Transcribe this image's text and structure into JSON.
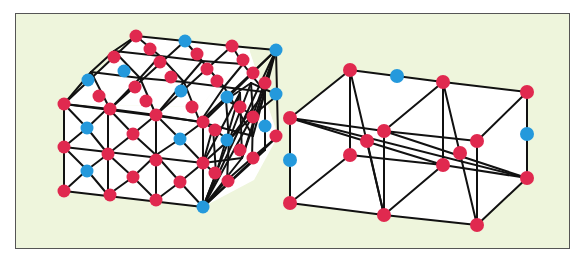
{
  "colors": {
    "background": "#eef5dc",
    "face": "#ffffff",
    "edge": "#111111",
    "red_node": "#e0294f",
    "blue_node": "#2499dc",
    "frame_border": "#555555"
  },
  "left_structure": {
    "name": "dense-triangulated-mesh-box",
    "faces": [
      {
        "name": "top",
        "points": "136,36 249,49 249,49 250,50 200,107 64,104"
      },
      {
        "name": "front",
        "points": "64,104 200,107 203,207 64,191"
      },
      {
        "name": "side",
        "points": "200,107 249,49 278,136 254,180 203,207"
      }
    ],
    "edges": [
      [
        136,
        36,
        185,
        41
      ],
      [
        185,
        41,
        232,
        46
      ],
      [
        232,
        46,
        276,
        50
      ],
      [
        114,
        51,
        160,
        56
      ],
      [
        160,
        56,
        202,
        61
      ],
      [
        202,
        61,
        243,
        64
      ],
      [
        91,
        72,
        140,
        78
      ],
      [
        140,
        78,
        184,
        82
      ],
      [
        184,
        82,
        224,
        87
      ],
      [
        224,
        87,
        265,
        92
      ],
      [
        64,
        104,
        110,
        109
      ],
      [
        110,
        109,
        156,
        115
      ],
      [
        156,
        115,
        200,
        122
      ],
      [
        200,
        122,
        253,
        136
      ],
      [
        136,
        36,
        64,
        104
      ],
      [
        185,
        41,
        110,
        109
      ],
      [
        232,
        46,
        156,
        115
      ],
      [
        276,
        50,
        200,
        122
      ],
      [
        136,
        36,
        160,
        56
      ],
      [
        160,
        56,
        184,
        82
      ],
      [
        184,
        82,
        200,
        122
      ],
      [
        185,
        41,
        202,
        61
      ],
      [
        202,
        61,
        224,
        87
      ],
      [
        224,
        87,
        253,
        136
      ],
      [
        232,
        46,
        243,
        64
      ],
      [
        243,
        64,
        265,
        92
      ],
      [
        114,
        51,
        140,
        78
      ],
      [
        140,
        78,
        156,
        115
      ],
      [
        91,
        72,
        110,
        109
      ],
      [
        136,
        36,
        114,
        51
      ],
      [
        114,
        51,
        91,
        72
      ],
      [
        91,
        72,
        64,
        104
      ],
      [
        160,
        56,
        140,
        78
      ],
      [
        140,
        78,
        110,
        109
      ],
      [
        202,
        61,
        184,
        82
      ],
      [
        184,
        82,
        156,
        115
      ],
      [
        243,
        64,
        224,
        87
      ],
      [
        224,
        87,
        200,
        122
      ],
      [
        276,
        50,
        265,
        92
      ],
      [
        265,
        92,
        253,
        136
      ],
      [
        64,
        104,
        64,
        191
      ],
      [
        108,
        108,
        108,
        195
      ],
      [
        156,
        115,
        156,
        200
      ],
      [
        203,
        122,
        203,
        207
      ],
      [
        64,
        104,
        203,
        122
      ],
      [
        64,
        147,
        203,
        163
      ],
      [
        64,
        191,
        203,
        207
      ],
      [
        64,
        104,
        87,
        128
      ],
      [
        87,
        128,
        108,
        108
      ],
      [
        87,
        128,
        64,
        147
      ],
      [
        87,
        128,
        108,
        154
      ],
      [
        64,
        147,
        87,
        170
      ],
      [
        87,
        170,
        108,
        154
      ],
      [
        87,
        170,
        64,
        191
      ],
      [
        87,
        170,
        108,
        195
      ],
      [
        108,
        108,
        133,
        134
      ],
      [
        133,
        134,
        156,
        115
      ],
      [
        133,
        134,
        108,
        154
      ],
      [
        133,
        134,
        156,
        155
      ],
      [
        108,
        154,
        133,
        177
      ],
      [
        133,
        177,
        156,
        155
      ],
      [
        133,
        177,
        108,
        195
      ],
      [
        133,
        177,
        156,
        200
      ],
      [
        156,
        115,
        180,
        139
      ],
      [
        180,
        139,
        203,
        122
      ],
      [
        180,
        139,
        156,
        155
      ],
      [
        180,
        139,
        203,
        163
      ],
      [
        156,
        155,
        180,
        182
      ],
      [
        180,
        182,
        203,
        163
      ],
      [
        180,
        182,
        156,
        200
      ],
      [
        180,
        182,
        203,
        207
      ],
      [
        203,
        122,
        276,
        50
      ],
      [
        203,
        207,
        278,
        136
      ],
      [
        276,
        50,
        278,
        136
      ],
      [
        203,
        122,
        226,
        100
      ],
      [
        226,
        100,
        251,
        83
      ],
      [
        203,
        163,
        229,
        140
      ],
      [
        229,
        140,
        253,
        115
      ],
      [
        253,
        115,
        278,
        95
      ],
      [
        203,
        207,
        227,
        180
      ],
      [
        227,
        180,
        252,
        158
      ],
      [
        252,
        158,
        278,
        136
      ],
      [
        203,
        122,
        229,
        140
      ],
      [
        229,
        140,
        227,
        180
      ],
      [
        226,
        100,
        253,
        115
      ],
      [
        253,
        115,
        252,
        158
      ],
      [
        251,
        83,
        278,
        95
      ],
      [
        213,
        127,
        216,
        174
      ],
      [
        226,
        100,
        229,
        140
      ],
      [
        240,
        93,
        242,
        158
      ],
      [
        251,
        83,
        253,
        115
      ],
      [
        265,
        92,
        265,
        150
      ],
      [
        203,
        163,
        213,
        127
      ],
      [
        203,
        163,
        216,
        174
      ],
      [
        203,
        163,
        240,
        93
      ],
      [
        203,
        163,
        242,
        158
      ],
      [
        203,
        207,
        216,
        174
      ],
      [
        203,
        207,
        229,
        140
      ],
      [
        203,
        207,
        242,
        158
      ],
      [
        203,
        207,
        253,
        115
      ],
      [
        203,
        207,
        265,
        150
      ],
      [
        203,
        207,
        276,
        50
      ],
      [
        229,
        140,
        251,
        83
      ],
      [
        229,
        140,
        265,
        92
      ],
      [
        242,
        158,
        265,
        92
      ],
      [
        242,
        158,
        276,
        50
      ],
      [
        253,
        115,
        276,
        50
      ],
      [
        216,
        174,
        240,
        93
      ]
    ],
    "nodes": [
      {
        "x": 136,
        "y": 36,
        "c": "red"
      },
      {
        "x": 185,
        "y": 41,
        "c": "blue"
      },
      {
        "x": 232,
        "y": 46,
        "c": "red"
      },
      {
        "x": 276,
        "y": 50,
        "c": "blue"
      },
      {
        "x": 150,
        "y": 49,
        "c": "red"
      },
      {
        "x": 197,
        "y": 54,
        "c": "red"
      },
      {
        "x": 243,
        "y": 60,
        "c": "red"
      },
      {
        "x": 114,
        "y": 57,
        "c": "red"
      },
      {
        "x": 160,
        "y": 62,
        "c": "red"
      },
      {
        "x": 207,
        "y": 69,
        "c": "red"
      },
      {
        "x": 253,
        "y": 73,
        "c": "red"
      },
      {
        "x": 124,
        "y": 71,
        "c": "blue"
      },
      {
        "x": 171,
        "y": 77,
        "c": "red"
      },
      {
        "x": 217,
        "y": 81,
        "c": "red"
      },
      {
        "x": 265,
        "y": 83,
        "c": "red"
      },
      {
        "x": 88,
        "y": 80,
        "c": "blue"
      },
      {
        "x": 135,
        "y": 87,
        "c": "red"
      },
      {
        "x": 181,
        "y": 91,
        "c": "blue"
      },
      {
        "x": 227,
        "y": 97,
        "c": "blue"
      },
      {
        "x": 276,
        "y": 94,
        "c": "blue"
      },
      {
        "x": 99,
        "y": 96,
        "c": "red"
      },
      {
        "x": 146,
        "y": 101,
        "c": "red"
      },
      {
        "x": 192,
        "y": 107,
        "c": "red"
      },
      {
        "x": 240,
        "y": 107,
        "c": "red"
      },
      {
        "x": 64,
        "y": 104,
        "c": "red"
      },
      {
        "x": 110,
        "y": 109,
        "c": "red"
      },
      {
        "x": 156,
        "y": 115,
        "c": "red"
      },
      {
        "x": 203,
        "y": 122,
        "c": "red"
      },
      {
        "x": 253,
        "y": 117,
        "c": "red"
      },
      {
        "x": 215,
        "y": 130,
        "c": "red"
      },
      {
        "x": 265,
        "y": 126,
        "c": "blue"
      },
      {
        "x": 276,
        "y": 136,
        "c": "red"
      },
      {
        "x": 87,
        "y": 128,
        "c": "blue"
      },
      {
        "x": 133,
        "y": 134,
        "c": "red"
      },
      {
        "x": 180,
        "y": 139,
        "c": "blue"
      },
      {
        "x": 227,
        "y": 140,
        "c": "blue"
      },
      {
        "x": 240,
        "y": 150,
        "c": "red"
      },
      {
        "x": 253,
        "y": 158,
        "c": "red"
      },
      {
        "x": 64,
        "y": 147,
        "c": "red"
      },
      {
        "x": 108,
        "y": 154,
        "c": "red"
      },
      {
        "x": 156,
        "y": 160,
        "c": "red"
      },
      {
        "x": 203,
        "y": 163,
        "c": "red"
      },
      {
        "x": 215,
        "y": 173,
        "c": "red"
      },
      {
        "x": 228,
        "y": 181,
        "c": "red"
      },
      {
        "x": 87,
        "y": 171,
        "c": "blue"
      },
      {
        "x": 133,
        "y": 177,
        "c": "red"
      },
      {
        "x": 180,
        "y": 182,
        "c": "red"
      },
      {
        "x": 64,
        "y": 191,
        "c": "red"
      },
      {
        "x": 110,
        "y": 195,
        "c": "red"
      },
      {
        "x": 156,
        "y": 200,
        "c": "red"
      },
      {
        "x": 203,
        "y": 207,
        "c": "blue"
      }
    ]
  },
  "right_structure": {
    "name": "sparse-cross-braced-box",
    "faces": [
      {
        "name": "outer",
        "points": "290,118 350,70 443,82 527,92 527,178 477,225 383,215 290,203"
      }
    ],
    "edges": [
      [
        290,
        118,
        350,
        70
      ],
      [
        350,
        70,
        443,
        82
      ],
      [
        443,
        82,
        527,
        92
      ],
      [
        290,
        118,
        384,
        131
      ],
      [
        384,
        131,
        477,
        141
      ],
      [
        350,
        70,
        350,
        155
      ],
      [
        443,
        82,
        443,
        165
      ],
      [
        527,
        92,
        527,
        178
      ],
      [
        290,
        118,
        290,
        203
      ],
      [
        384,
        131,
        384,
        215
      ],
      [
        477,
        141,
        477,
        225
      ],
      [
        290,
        203,
        384,
        215
      ],
      [
        384,
        215,
        477,
        225
      ],
      [
        290,
        203,
        350,
        155
      ],
      [
        384,
        215,
        443,
        165
      ],
      [
        477,
        225,
        527,
        178
      ],
      [
        350,
        155,
        443,
        165
      ],
      [
        443,
        165,
        527,
        178
      ],
      [
        384,
        131,
        443,
        82
      ],
      [
        477,
        141,
        527,
        92
      ],
      [
        290,
        118,
        443,
        165
      ],
      [
        290,
        118,
        527,
        178
      ],
      [
        384,
        131,
        527,
        178
      ],
      [
        350,
        70,
        384,
        215
      ],
      [
        443,
        82,
        477,
        225
      ],
      [
        367,
        141,
        384,
        215
      ]
    ],
    "nodes": [
      {
        "x": 350,
        "y": 70,
        "c": "red"
      },
      {
        "x": 397,
        "y": 76,
        "c": "blue"
      },
      {
        "x": 443,
        "y": 82,
        "c": "red"
      },
      {
        "x": 527,
        "y": 92,
        "c": "red"
      },
      {
        "x": 290,
        "y": 118,
        "c": "red"
      },
      {
        "x": 384,
        "y": 131,
        "c": "red"
      },
      {
        "x": 477,
        "y": 141,
        "c": "red"
      },
      {
        "x": 367,
        "y": 141,
        "c": "red"
      },
      {
        "x": 460,
        "y": 153,
        "c": "red"
      },
      {
        "x": 527,
        "y": 134,
        "c": "blue"
      },
      {
        "x": 290,
        "y": 160,
        "c": "blue"
      },
      {
        "x": 350,
        "y": 155,
        "c": "red"
      },
      {
        "x": 443,
        "y": 165,
        "c": "red"
      },
      {
        "x": 527,
        "y": 178,
        "c": "red"
      },
      {
        "x": 290,
        "y": 203,
        "c": "red"
      },
      {
        "x": 384,
        "y": 215,
        "c": "red"
      },
      {
        "x": 477,
        "y": 225,
        "c": "red"
      }
    ]
  }
}
